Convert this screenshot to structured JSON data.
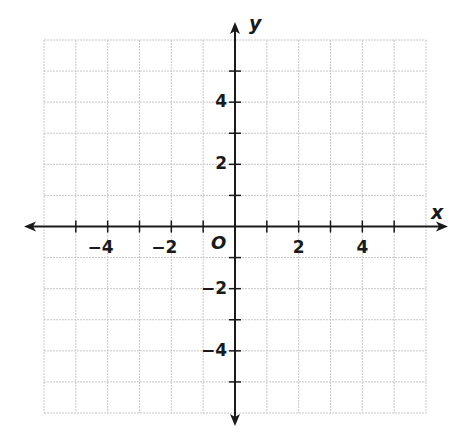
{
  "chart_data": {
    "type": "scatter",
    "title": "",
    "xlabel": "x",
    "ylabel": "y",
    "origin_label": "O",
    "xlim": [
      -6,
      6
    ],
    "ylim": [
      -6,
      6
    ],
    "grid": true,
    "grid_step": 1,
    "tick_step": 1,
    "x_tick_labels": [
      {
        "value": -4,
        "label": "−4"
      },
      {
        "value": -2,
        "label": "−2"
      },
      {
        "value": 2,
        "label": "2"
      },
      {
        "value": 4,
        "label": "4"
      }
    ],
    "y_tick_labels": [
      {
        "value": 4,
        "label": "4"
      },
      {
        "value": 2,
        "label": "2"
      },
      {
        "value": -2,
        "label": "−2"
      },
      {
        "value": -4,
        "label": "−4"
      }
    ],
    "series": [],
    "colors": {
      "grid": "#c8c8c8",
      "axis": "#1a1a1a"
    }
  }
}
